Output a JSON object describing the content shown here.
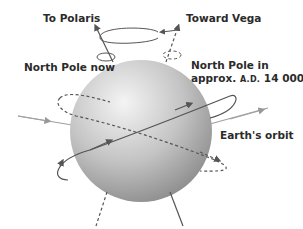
{
  "labels": {
    "polaris": "To Polaris",
    "vega": "Toward Vega",
    "north_pole_now": "North Pole now",
    "north_pole_future_line1": "North Pole in",
    "north_pole_future_line2_prefix": "approx. ",
    "north_pole_future_era": "A.D.",
    "north_pole_future_year": " 14 000",
    "orbit": "Earth's orbit"
  },
  "colors": {
    "sphere_light": "#f2f2f2",
    "sphere_dark": "#8a8a8a",
    "axis_line": "#555555",
    "orbit_line": "#9a9a9a",
    "text": "#2b2b2b"
  }
}
